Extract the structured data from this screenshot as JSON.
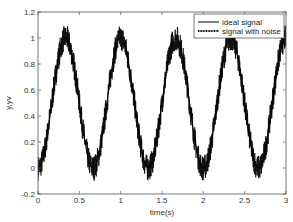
{
  "chart_data": {
    "type": "line",
    "title": "",
    "xlabel": "time(s)",
    "ylabel": "y,yv",
    "xlim": [
      0,
      3
    ],
    "ylim": [
      -0.2,
      1.2
    ],
    "xticks": [
      0,
      0.5,
      1,
      1.5,
      2,
      2.5,
      3
    ],
    "xtick_labels": [
      "0",
      "0.5",
      "1",
      "1.5",
      "2",
      "2.5",
      "3"
    ],
    "yticks": [
      -0.2,
      0,
      0.2,
      0.4,
      0.6,
      0.8,
      1,
      1.2
    ],
    "ytick_labels": [
      "-0.2",
      "0",
      "0.2",
      "0.4",
      "0.6",
      "0.8",
      "1",
      "1.2"
    ],
    "grid": false,
    "legend_position": "upper right",
    "series": [
      {
        "name": "ideal signal",
        "style": "solid",
        "color": "#000000",
        "description": "0.5 - 0.5*cos(2*pi*1.5*t)",
        "x": [
          0,
          0.333,
          0.667,
          1.0,
          1.333,
          1.667,
          2.0,
          2.333,
          2.667,
          3.0
        ],
        "values": [
          0,
          1,
          0,
          1,
          0,
          1,
          0,
          1,
          0,
          1
        ]
      },
      {
        "name": "signal with noise",
        "style": "dotted",
        "color": "#000000",
        "noise_amplitude": 0.1,
        "x": [
          0,
          0.333,
          0.667,
          1.0,
          1.333,
          1.667,
          2.0,
          2.333,
          2.667,
          3.0
        ],
        "values": [
          0,
          1,
          0,
          1,
          0,
          1,
          0,
          1,
          0,
          1
        ]
      }
    ]
  }
}
